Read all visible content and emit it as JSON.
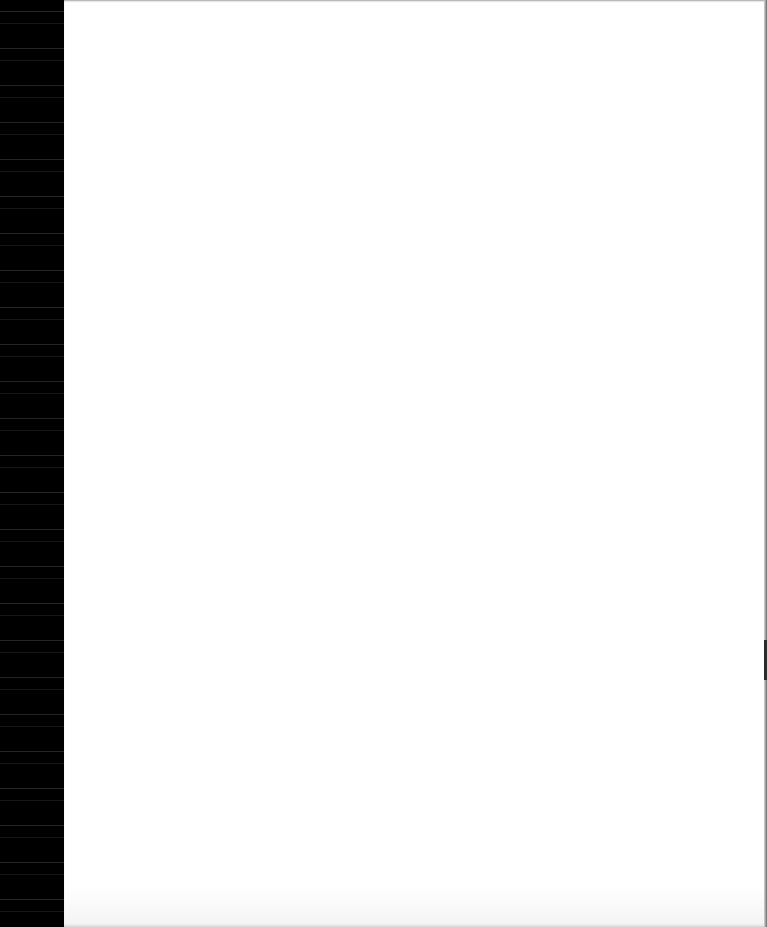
{
  "document": {
    "type": "scanned-page",
    "content": "",
    "page_color": "#ffffff",
    "left_edge_color": "#000000"
  }
}
